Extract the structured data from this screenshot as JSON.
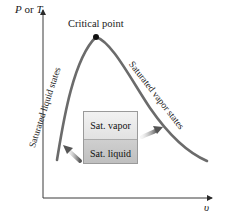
{
  "diagram": {
    "y_axis": {
      "label_var1": "P",
      "label_or": " or ",
      "label_var2": "T"
    },
    "x_axis": {
      "label": "υ"
    },
    "critical_point": {
      "label": "Critical point"
    },
    "curves": {
      "left": {
        "label": "Saturated liquid states"
      },
      "right": {
        "label": "Saturated vapor states"
      }
    },
    "container": {
      "top_label": "Sat. vapor",
      "bottom_label": "Sat. liquid"
    },
    "colors": {
      "curve": "#6b6b6b",
      "axis": "#3a3a3a",
      "arrow": "#555555",
      "dot": "#111111"
    }
  }
}
